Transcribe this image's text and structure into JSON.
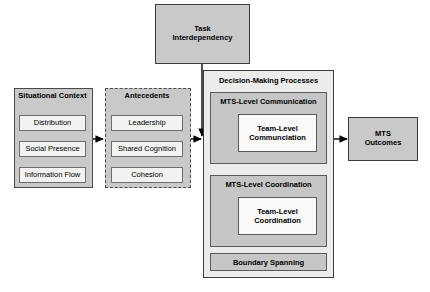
{
  "diagram": {
    "title_hidden": "",
    "task_interdependency": {
      "label_line1": "Task",
      "label_line2": "Interdependency"
    },
    "situational_context": {
      "title": "Situational Context",
      "items": [
        {
          "label": "Distribution"
        },
        {
          "label": "Social Presence"
        },
        {
          "label": "Information Flow"
        }
      ]
    },
    "antecedents": {
      "title": "Antecedents",
      "items": [
        {
          "label": "Leadership"
        },
        {
          "label": "Shared Cognition"
        },
        {
          "label": "Cohesion"
        }
      ]
    },
    "decision_making": {
      "title": "Decision-Making Processes",
      "communication": {
        "title": "MTS-Level Communication",
        "inner_line1": "Team-Level",
        "inner_line2": "Communciation"
      },
      "coordination": {
        "title": "MTS-Level Coordination",
        "inner_line1": "Team-Level",
        "inner_line2": "Coordination"
      },
      "boundary_spanning": {
        "label": "Boundary Spanning"
      }
    },
    "mts_outcomes": {
      "label_line1": "MTS",
      "label_line2": "Outcomes"
    },
    "colors": {
      "group_fill": "#c9c9c9",
      "group_border": "#4a4a4a",
      "leaf_fill": "#f2f2f2",
      "leaf_border": "#6d6d6d",
      "processes_fill": "#ececec",
      "sub_fill": "#c6c6c6",
      "inner_fill": "#fafafa",
      "arrow": "#000000",
      "background": "#ffffff"
    }
  }
}
